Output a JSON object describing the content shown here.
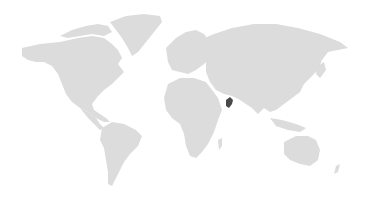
{
  "map": {
    "type": "world-choropleth",
    "land_color": "#dcdcdc",
    "background_color": "#ffffff",
    "highlight_color": "#4a4a4a",
    "highlighted_regions": [
      {
        "name": "Oman",
        "approx_px": {
          "x": 229,
          "y": 103
        }
      }
    ],
    "continents": [
      "North America",
      "Greenland",
      "South America",
      "Europe",
      "Africa",
      "Asia",
      "Australia",
      "New Zealand",
      "Madagascar"
    ]
  }
}
